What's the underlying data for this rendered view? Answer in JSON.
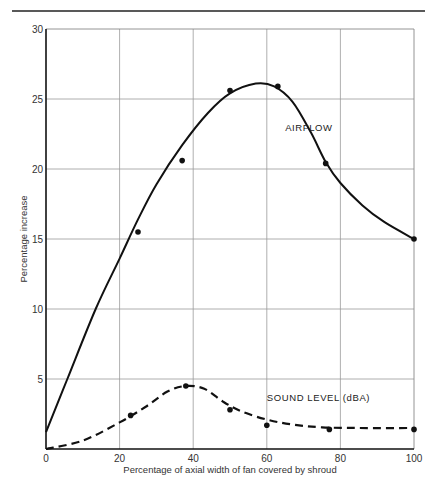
{
  "chart_data": {
    "type": "line",
    "title": "",
    "xlabel": "Percentage of axial width of fan covered by shroud",
    "ylabel": "Percentage increase",
    "xlim": [
      0,
      100
    ],
    "ylim": [
      0,
      30
    ],
    "xticks": [
      0,
      20,
      40,
      60,
      80,
      100
    ],
    "yticks": [
      5,
      10,
      15,
      20,
      25,
      30
    ],
    "grid": true,
    "legend_position": "inline labels",
    "series": [
      {
        "name": "AIRFLOW",
        "style": "solid",
        "label_position": [
          65,
          22.7
        ],
        "points": [
          [
            25,
            15.5
          ],
          [
            37,
            20.6
          ],
          [
            50,
            25.6
          ],
          [
            63,
            25.9
          ],
          [
            76,
            20.4
          ],
          [
            100,
            15.0
          ]
        ],
        "curve": [
          [
            0,
            1.2
          ],
          [
            5.8,
            5
          ],
          [
            13.5,
            10
          ],
          [
            20,
            13.6
          ],
          [
            25,
            16.4
          ],
          [
            30,
            18.9
          ],
          [
            37,
            21.7
          ],
          [
            44,
            24.0
          ],
          [
            50,
            25.4
          ],
          [
            57,
            26.1
          ],
          [
            62,
            25.9
          ],
          [
            67,
            24.8
          ],
          [
            72,
            22.6
          ],
          [
            76,
            20.5
          ],
          [
            80,
            19.0
          ],
          [
            86,
            17.4
          ],
          [
            92,
            16.2
          ],
          [
            100,
            15.0
          ]
        ]
      },
      {
        "name": "SOUND LEVEL (dBA)",
        "style": "dashed",
        "label_position": [
          60,
          3.45
        ],
        "points": [
          [
            23,
            2.4
          ],
          [
            38,
            4.5
          ],
          [
            50,
            2.8
          ],
          [
            60,
            1.7
          ],
          [
            77,
            1.4
          ],
          [
            100,
            1.4
          ]
        ],
        "curve": [
          [
            0,
            0
          ],
          [
            10,
            0.6
          ],
          [
            20,
            1.9
          ],
          [
            27,
            3.0
          ],
          [
            33,
            4.1
          ],
          [
            38,
            4.5
          ],
          [
            43,
            4.3
          ],
          [
            48,
            3.4
          ],
          [
            53,
            2.7
          ],
          [
            60,
            2.1
          ],
          [
            67,
            1.75
          ],
          [
            75,
            1.55
          ],
          [
            85,
            1.5
          ],
          [
            100,
            1.5
          ]
        ]
      }
    ]
  },
  "axes": {
    "x_tick_labels": [
      "0",
      "20",
      "40",
      "60",
      "80",
      "100"
    ],
    "y_tick_labels": [
      "5",
      "10",
      "15",
      "20",
      "25",
      "30"
    ]
  }
}
